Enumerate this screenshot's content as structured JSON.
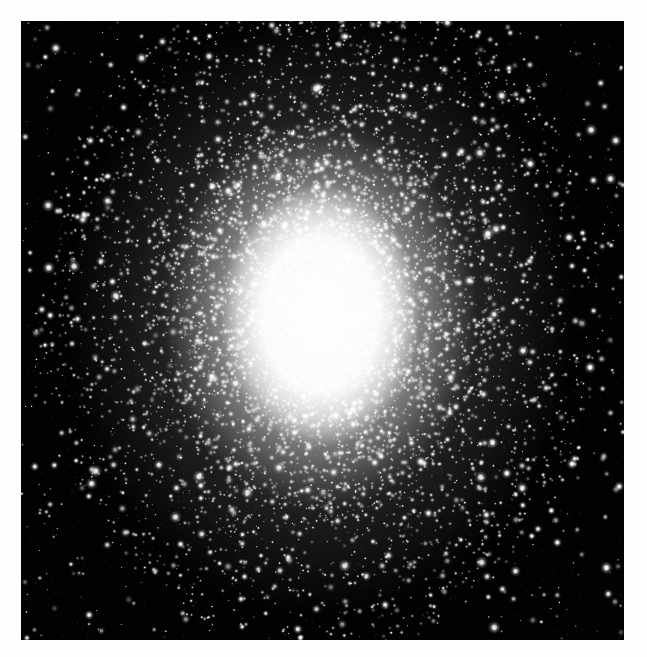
{
  "image": {
    "description": "Black-and-white telescope photograph of a globular star cluster with a brilliant saturated white core surrounded by a dense grainy halo of thousands of stars thinning into a sparse black star field, printed inside a white border",
    "frame_color": "#fefefe",
    "sky_color": "#020202",
    "star_color": "#ffffff",
    "photo": {
      "left": 21,
      "top": 21,
      "width": 603,
      "height": 619
    },
    "cluster": {
      "seed": 1337,
      "center_x": 299,
      "center_y": 294,
      "elongation_y": 1.18,
      "core_rx": 100,
      "core_ry": 132,
      "mid_glow_rx": 158,
      "mid_glow_ry": 196,
      "outer_haze_rx": 255,
      "outer_haze_ry": 300,
      "halo_radius": 285,
      "unresolved_halo_count": 4200,
      "resolved_halo_count": 1700,
      "core_edge_grain_count": 1100,
      "field_star_count": 900,
      "bright_star_count": 170,
      "film_grain_count": 2600
    }
  }
}
